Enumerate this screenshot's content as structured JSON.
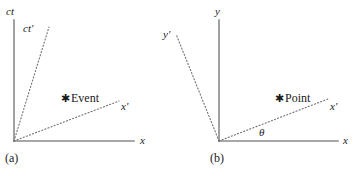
{
  "figure": {
    "background": "#ffffff",
    "axis_color": "#8a8a8a",
    "dotted_color": "#6e6e6e",
    "text_color": "#1a1a1a"
  },
  "panels": [
    {
      "caption": "(a)",
      "type": "minkowski-spacetime-diagram",
      "origin": {
        "x": 14,
        "y": 141
      },
      "axes": [
        {
          "name": "ct-axis",
          "label": "ct",
          "style": "solid",
          "label_pos": {
            "x": 6,
            "y": 6
          },
          "line": {
            "x1": 14,
            "y1": 141,
            "x2": 14,
            "y2": 20
          }
        },
        {
          "name": "x-axis",
          "label": "x",
          "style": "solid",
          "label_pos": {
            "x": 140,
            "y": 135
          },
          "line": {
            "x1": 14,
            "y1": 141,
            "x2": 134,
            "y2": 141
          }
        },
        {
          "name": "ct-prime-axis",
          "label": "ct'",
          "style": "dotted",
          "label_pos": {
            "x": 23,
            "y": 23
          },
          "line": {
            "x1": 14,
            "y1": 141,
            "x2": 49,
            "y2": 27
          }
        },
        {
          "name": "x-prime-axis",
          "label": "x'",
          "style": "dotted",
          "label_pos": {
            "x": 121,
            "y": 101
          },
          "line": {
            "x1": 14,
            "y1": 141,
            "x2": 119,
            "y2": 101
          }
        }
      ],
      "marker": {
        "name": "event-marker",
        "symbol": "✱",
        "label": "Event",
        "pos": {
          "x": 61,
          "y": 92
        }
      }
    },
    {
      "caption": "(b)",
      "type": "euclidean-rotation-diagram",
      "origin": {
        "x": 219,
        "y": 141
      },
      "axes": [
        {
          "name": "y-axis",
          "label": "y",
          "style": "solid",
          "label_pos": {
            "x": 215,
            "y": 6
          },
          "line": {
            "x1": 219,
            "y1": 141,
            "x2": 219,
            "y2": 20
          }
        },
        {
          "name": "x-axis",
          "label": "x",
          "style": "solid",
          "label_pos": {
            "x": 343,
            "y": 135
          },
          "line": {
            "x1": 219,
            "y1": 141,
            "x2": 338,
            "y2": 141
          }
        },
        {
          "name": "y-prime-axis",
          "label": "y'",
          "style": "dotted",
          "label_pos": {
            "x": 163,
            "y": 29
          },
          "line": {
            "x1": 219,
            "y1": 141,
            "x2": 176,
            "y2": 34
          }
        },
        {
          "name": "x-prime-axis",
          "label": "x'",
          "style": "dotted",
          "label_pos": {
            "x": 330,
            "y": 101
          },
          "line": {
            "x1": 219,
            "y1": 141,
            "x2": 328,
            "y2": 99
          }
        }
      ],
      "marker": {
        "name": "point-marker",
        "symbol": "✱",
        "label": "Point",
        "pos": {
          "x": 275,
          "y": 92
        }
      },
      "angle": {
        "name": "theta-angle-label",
        "symbol": "θ",
        "pos": {
          "x": 259,
          "y": 127
        }
      }
    }
  ]
}
